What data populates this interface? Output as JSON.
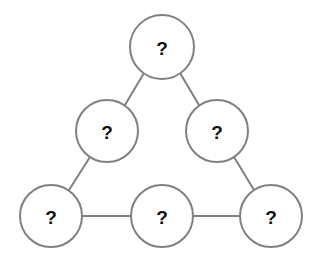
{
  "diagram": {
    "type": "node-link-graph",
    "shape": "triangle",
    "canvas": {
      "width": 317,
      "height": 270
    },
    "colors": {
      "background": "#ffffff",
      "node_fill": "#ffffff",
      "node_stroke": "#808080",
      "edge_stroke": "#808080",
      "label_text": "#111111"
    },
    "stroke_width": 2,
    "node_radius": 31,
    "node_count": 6,
    "edge_count": 6,
    "nodes": [
      {
        "id": "top",
        "label": "?",
        "cx": 162,
        "cy": 47,
        "r": 32,
        "position": "apex"
      },
      {
        "id": "left-middle",
        "label": "?",
        "cx": 107,
        "cy": 131,
        "r": 31,
        "position": "left-middle"
      },
      {
        "id": "right-middle",
        "label": "?",
        "cx": 217,
        "cy": 131,
        "r": 31,
        "position": "right-middle"
      },
      {
        "id": "bottom-left",
        "label": "?",
        "cx": 51,
        "cy": 216,
        "r": 31,
        "position": "bottom-left"
      },
      {
        "id": "bottom-center",
        "label": "?",
        "cx": 162,
        "cy": 216,
        "r": 31,
        "position": "bottom-center"
      },
      {
        "id": "bottom-right",
        "label": "?",
        "cx": 271,
        "cy": 216,
        "r": 31,
        "position": "bottom-right"
      }
    ],
    "edges": [
      {
        "id": "top-to-left-middle",
        "from": "top",
        "to": "left-middle",
        "x1": 144,
        "y1": 73,
        "x2": 125,
        "y2": 105
      },
      {
        "id": "top-to-right-middle",
        "from": "top",
        "to": "right-middle",
        "x1": 180,
        "y1": 73,
        "x2": 199,
        "y2": 105
      },
      {
        "id": "left-middle-to-bottom-left",
        "from": "left-middle",
        "to": "bottom-left",
        "x1": 90,
        "y1": 157,
        "x2": 69,
        "y2": 190
      },
      {
        "id": "right-middle-to-bottom-right",
        "from": "right-middle",
        "to": "bottom-right",
        "x1": 234,
        "y1": 157,
        "x2": 254,
        "y2": 190
      },
      {
        "id": "bottom-left-to-bottom-center",
        "from": "bottom-left",
        "to": "bottom-center",
        "x1": 82,
        "y1": 216,
        "x2": 131,
        "y2": 216
      },
      {
        "id": "bottom-center-to-bottom-right",
        "from": "bottom-center",
        "to": "bottom-right",
        "x1": 193,
        "y1": 216,
        "x2": 240,
        "y2": 216
      }
    ]
  }
}
